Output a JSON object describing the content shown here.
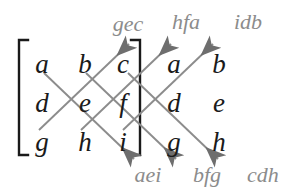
{
  "figure": {
    "background_color": "#ffffff",
    "entry_color": "#1a1a1a",
    "label_color": "#8c8c8c",
    "line_color": "#8c8c8c",
    "arrowhead_color": "#6e6e6e",
    "bracket_color": "#1a1a1a"
  },
  "matrix": {
    "rows": [
      [
        "a",
        "b",
        "c"
      ],
      [
        "d",
        "e",
        "f"
      ],
      [
        "g",
        "h",
        "i"
      ]
    ],
    "repeated_columns": [
      [
        "a",
        "b"
      ],
      [
        "d",
        "e"
      ],
      [
        "g",
        "h"
      ]
    ],
    "entries": {
      "r0c0": "a",
      "r0c1": "b",
      "r0c2": "c",
      "r0c3": "a",
      "r0c4": "b",
      "r1c0": "d",
      "r1c1": "e",
      "r1c2": "f",
      "r1c3": "d",
      "r1c4": "e",
      "r2c0": "g",
      "r2c1": "h",
      "r2c2": "i",
      "r2c3": "g",
      "r2c4": "h"
    }
  },
  "products": {
    "upward": [
      {
        "id": "gec",
        "text": "gec",
        "direction": "up-right"
      },
      {
        "id": "hfa",
        "text": "hfa",
        "direction": "up-right"
      },
      {
        "id": "idb",
        "text": "idb",
        "direction": "up-right"
      }
    ],
    "downward": [
      {
        "id": "aei",
        "text": "aei",
        "direction": "down-right"
      },
      {
        "id": "bfg",
        "text": "bfg",
        "direction": "down-right"
      },
      {
        "id": "cdh",
        "text": "cdh",
        "direction": "down-right"
      }
    ],
    "top_labels": [
      "gec",
      "hfa",
      "idb"
    ],
    "bottom_labels": [
      "aei",
      "bfg",
      "cdh"
    ]
  },
  "brackets": {
    "left": "[",
    "right": "]"
  }
}
